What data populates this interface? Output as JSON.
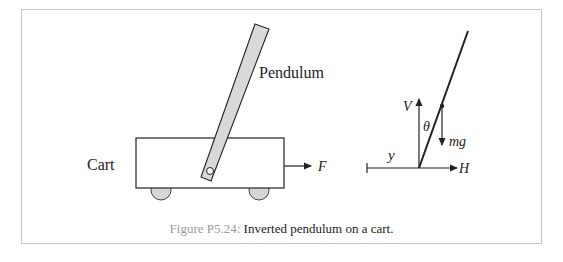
{
  "figure": {
    "caption_label": "Figure P5.24:",
    "caption_text": " Inverted pendulum on a cart."
  },
  "left_diagram": {
    "pendulum_label": "Pendulum",
    "cart_label": "Cart",
    "force_label": "F"
  },
  "right_diagram": {
    "vertical_force_label": "V",
    "angle_label": "θ",
    "gravity_label": "mg",
    "displacement_label": "y",
    "horizontal_force_label": "H"
  },
  "colors": {
    "frame_border": "#c9c9c9",
    "caption_label": "#9a9a9a",
    "pendulum_fill": "#d9d9d9",
    "wheel_fill": "#d6d6d6",
    "stroke": "#222222"
  }
}
